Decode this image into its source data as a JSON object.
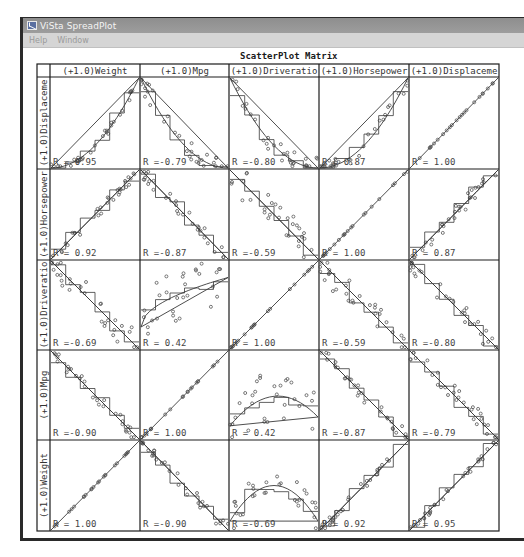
{
  "window": {
    "title": "ViSta SpreadPlot",
    "icon": "vista-app-icon"
  },
  "menubar": {
    "items": [
      {
        "label": "Help"
      },
      {
        "label": "Window"
      }
    ]
  },
  "chart_data": {
    "type": "scatter",
    "title": "ScatterPlot Matrix",
    "columns": [
      "(+1.0)Weight",
      "(+1.0)Mpg",
      "(+1.0)Driveratio",
      "(+1.0)Horsepower",
      "(+1.0)Displaceme"
    ],
    "rows": [
      "(+1.0)Displaceme",
      "(+1.0)Horsepower",
      "(+1.0)Driveratio",
      "(+1.0)Mpg",
      "(+1.0)Weight"
    ],
    "correlations": [
      [
        "R = 0.95",
        "R =-0.79",
        "R =-0.80",
        "R = 0.87",
        "R = 1.00"
      ],
      [
        "R = 0.92",
        "R =-0.87",
        "R =-0.59",
        "R = 1.00",
        "R = 0.87"
      ],
      [
        "R =-0.69",
        "R = 0.42",
        "R = 1.00",
        "R =-0.59",
        "R =-0.80"
      ],
      [
        "R =-0.90",
        "R = 1.00",
        "R = 0.42",
        "R =-0.87",
        "R =-0.79"
      ],
      [
        "R = 1.00",
        "R =-0.90",
        "R =-0.69",
        "R = 0.92",
        "R = 0.95"
      ]
    ],
    "r_values": [
      [
        0.95,
        -0.79,
        -0.8,
        0.87,
        1.0
      ],
      [
        0.92,
        -0.87,
        -0.59,
        1.0,
        0.87
      ],
      [
        -0.69,
        0.42,
        1.0,
        -0.59,
        -0.8
      ],
      [
        -0.9,
        1.0,
        0.42,
        -0.87,
        -0.79
      ],
      [
        1.0,
        -0.9,
        -0.69,
        0.92,
        0.95
      ]
    ],
    "cell_shapes": [
      [
        "convex-increasing",
        "convex-decreasing",
        "convex-decreasing",
        "convex-increasing",
        "identity"
      ],
      [
        "increasing",
        "decreasing",
        "decreasing",
        "identity",
        "increasing"
      ],
      [
        "decreasing",
        "concave-increasing",
        "identity",
        "decreasing",
        "decreasing"
      ],
      [
        "decreasing",
        "identity",
        "concave-arch",
        "decreasing",
        "decreasing"
      ],
      [
        "identity",
        "decreasing",
        "arch",
        "increasing",
        "increasing"
      ]
    ],
    "overlays": [
      "points",
      "linear-fit",
      "smooth-fit",
      "step-fit"
    ],
    "axis_range": [
      0,
      1
    ],
    "grid": false,
    "legend": "none"
  }
}
